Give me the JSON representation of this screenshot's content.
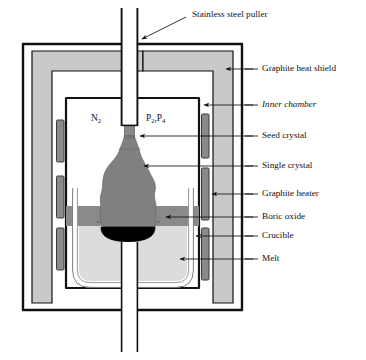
{
  "figure": {
    "labels": [
      {
        "id": "stainless-steel-puller",
        "text": "Stainless steel puller",
        "italic": false
      },
      {
        "id": "graphite-heat-shield",
        "text": "Graphite heat shield",
        "italic": false
      },
      {
        "id": "inner-chamber",
        "text": "Inner chamber",
        "italic": true
      },
      {
        "id": "seed-crystal",
        "text": "Seed crystal",
        "italic": false
      },
      {
        "id": "single-crystal",
        "text": "Single crystal",
        "italic": false
      },
      {
        "id": "graphite-heater",
        "text": "Graphite heater",
        "italic": false
      },
      {
        "id": "boric-oxide",
        "text": "Boric oxide",
        "italic": false
      },
      {
        "id": "crucible",
        "text": "Crucible",
        "italic": false
      },
      {
        "id": "melt",
        "text": "Melt",
        "italic": false
      }
    ],
    "gas_labels": [
      {
        "id": "nitrogen",
        "base": "N",
        "subscript": "2"
      },
      {
        "id": "phosphorus",
        "base_1": "P",
        "subscript_1": "2",
        "separator": ",",
        "base_2": "P",
        "subscript_2": "4"
      }
    ],
    "colors": {
      "outline": "#111111",
      "shield_fill": "#c9c9c9",
      "heater_fill": "#8a8a8a",
      "crystal_fill": "#808080",
      "boric_oxide_fill": "#8a8a8a",
      "melt_fill": "#dcdcdc",
      "crystal_base": "#000000",
      "background": "#ffffff",
      "crucible_wall": "#ffffff"
    }
  }
}
